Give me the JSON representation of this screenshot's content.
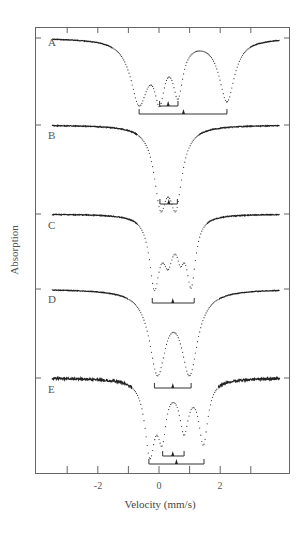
{
  "chart_data": {
    "type": "line",
    "title": "",
    "xlabel": "Velocity (mm/s)",
    "ylabel": "Absorption",
    "xlim": [
      -3.9,
      4.3
    ],
    "x_ticks": [
      -3,
      -2,
      -1,
      0,
      1,
      2,
      3
    ],
    "x_tick_labels": [
      {
        "value": -2,
        "label": "-2"
      },
      {
        "value": 0,
        "label": "0"
      },
      {
        "value": 2,
        "label": "2"
      }
    ],
    "grid": false,
    "legend": null,
    "style": "stacked Mossbauer spectra, dotted absorption lines, solid baselines",
    "series": [
      {
        "name": "A",
        "baseline_y_px": 38,
        "noise": 0.6,
        "lines": [
          {
            "center": -0.65,
            "depth": 62,
            "width": 0.34
          },
          {
            "center": 0.02,
            "depth": 50,
            "width": 0.2
          },
          {
            "center": 0.62,
            "depth": 50,
            "width": 0.2
          },
          {
            "center": 2.22,
            "depth": 62,
            "width": 0.3
          }
        ],
        "markers": [
          {
            "type": "doublet",
            "left": -0.65,
            "right": 2.22,
            "center": 0.8,
            "y_px": 114
          },
          {
            "type": "doublet",
            "left": 0.02,
            "right": 0.62,
            "center": 0.3,
            "y_px": 106
          }
        ]
      },
      {
        "name": "B",
        "baseline_y_px": 125,
        "noise": 0.8,
        "lines": [
          {
            "center": 0.05,
            "depth": 72,
            "width": 0.25
          },
          {
            "center": 0.55,
            "depth": 72,
            "width": 0.25
          }
        ],
        "markers": [
          {
            "type": "doublet",
            "left": 0.03,
            "right": 0.6,
            "center": 0.32,
            "y_px": 204
          }
        ]
      },
      {
        "name": "C",
        "baseline_y_px": 214,
        "noise": 0.8,
        "lines": [
          {
            "center": -0.15,
            "depth": 68,
            "width": 0.2
          },
          {
            "center": 0.3,
            "depth": 38,
            "width": 0.2
          },
          {
            "center": 0.7,
            "depth": 28,
            "width": 0.14
          },
          {
            "center": 1.05,
            "depth": 66,
            "width": 0.18
          }
        ],
        "markers": [
          {
            "type": "doublet",
            "left": -0.22,
            "right": 1.15,
            "center": 0.45,
            "y_px": 303
          }
        ]
      },
      {
        "name": "D",
        "baseline_y_px": 289,
        "noise": 0.6,
        "lines": [
          {
            "center": -0.05,
            "depth": 80,
            "width": 0.32
          },
          {
            "center": 1.0,
            "depth": 80,
            "width": 0.32
          }
        ],
        "markers": [
          {
            "type": "doublet",
            "left": -0.15,
            "right": 1.05,
            "center": 0.45,
            "y_px": 388
          }
        ]
      },
      {
        "name": "E",
        "baseline_y_px": 378,
        "noise": 2.2,
        "lines": [
          {
            "center": -0.3,
            "depth": 72,
            "width": 0.2
          },
          {
            "center": 0.1,
            "depth": 50,
            "width": 0.16
          },
          {
            "center": 0.82,
            "depth": 48,
            "width": 0.18
          },
          {
            "center": 1.45,
            "depth": 62,
            "width": 0.18
          }
        ],
        "markers": [
          {
            "type": "doublet",
            "left": 0.12,
            "right": 0.82,
            "center": 0.45,
            "y_px": 456
          },
          {
            "type": "doublet",
            "left": -0.33,
            "right": 1.47,
            "center": 0.57,
            "y_px": 464
          }
        ]
      }
    ]
  },
  "axes": {
    "x_label": "Velocity (mm/s)",
    "y_label": "Absorption",
    "tick_labels": [
      "-2",
      "0",
      "2"
    ]
  },
  "panel_labels": [
    "A",
    "B",
    "C",
    "D",
    "E"
  ]
}
